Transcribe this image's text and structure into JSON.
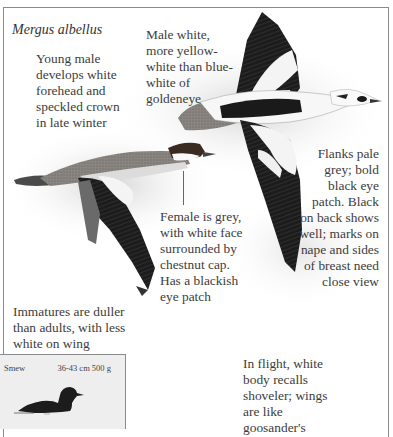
{
  "page": {
    "species_name": "Mergus albellus"
  },
  "annotations": {
    "young_male": "Young male\ndevelops white\nforehead and\nspeckled crown\nin late winter",
    "male_white": "Male white,\nmore yellow-\nwhite than blue-\nwhite of\ngoldeneye",
    "flanks": "Flanks pale\ngrey; bold\nblack eye\npatch. Black\non back shows\nwell; marks on\nnape and sides\nof breast need\nclose view",
    "female": "Female is grey,\nwith white face\nsurrounded by\nchestnut cap.\nHas a blackish\neye patch",
    "immatures": "Immatures are duller\nthan adults, with less\nwhite on wing",
    "in_flight": "In flight, white\nbody recalls\nshoveler; wings\nare like\ngoosander's"
  },
  "inset": {
    "common_name": "Smew",
    "size": "36-43 cm  500 g",
    "silhouette_icon": "swimming-duck-silhouette"
  },
  "colors": {
    "frame_border": "#8a8a8a",
    "inset_bg": "#eeeeee",
    "text": "#3c3c3c",
    "bird_black": "#1a1a1a",
    "bird_grey": "#7a7a7a"
  }
}
